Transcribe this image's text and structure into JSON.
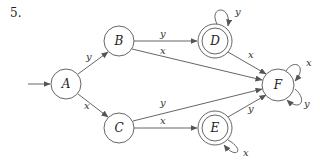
{
  "problem_number": "5.",
  "diagram_type": "finite-state-automaton",
  "start_state": "A",
  "accepting_states": [
    "D",
    "E"
  ],
  "states": [
    {
      "id": "A",
      "label": "A",
      "accepting": false
    },
    {
      "id": "B",
      "label": "B",
      "accepting": false
    },
    {
      "id": "C",
      "label": "C",
      "accepting": false
    },
    {
      "id": "D",
      "label": "D",
      "accepting": true
    },
    {
      "id": "E",
      "label": "E",
      "accepting": true
    },
    {
      "id": "F",
      "label": "F",
      "accepting": false
    }
  ],
  "transitions": [
    {
      "from": "A",
      "to": "B",
      "symbol": "y"
    },
    {
      "from": "A",
      "to": "C",
      "symbol": "x"
    },
    {
      "from": "B",
      "to": "D",
      "symbol": "y"
    },
    {
      "from": "B",
      "to": "F",
      "symbol": "x"
    },
    {
      "from": "C",
      "to": "F",
      "symbol": "y"
    },
    {
      "from": "C",
      "to": "E",
      "symbol": "x"
    },
    {
      "from": "D",
      "to": "D",
      "symbol": "y"
    },
    {
      "from": "D",
      "to": "F",
      "symbol": "x"
    },
    {
      "from": "E",
      "to": "E",
      "symbol": "x"
    },
    {
      "from": "E",
      "to": "F",
      "symbol": "y"
    },
    {
      "from": "F",
      "to": "F",
      "symbol": "x"
    },
    {
      "from": "F",
      "to": "F",
      "symbol": "y"
    }
  ],
  "colors": {
    "stroke": "#555555",
    "text": "#222222",
    "background": "#ffffff"
  }
}
